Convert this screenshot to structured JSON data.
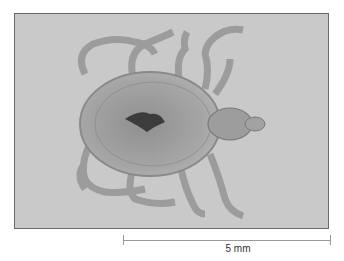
{
  "figure": {
    "background_color": "#c9c9c9",
    "scale_bar": {
      "label": "5 mm"
    }
  }
}
